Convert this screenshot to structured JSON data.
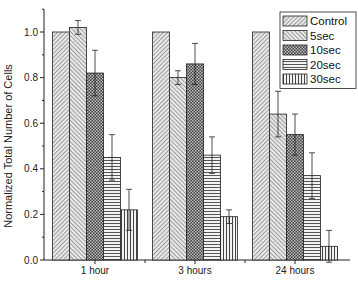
{
  "chart_data": {
    "type": "bar",
    "title": "",
    "xlabel": "",
    "ylabel": "Normalized Total Number of Cells",
    "ylim": [
      0.0,
      1.1
    ],
    "yticks": [
      "0.0",
      "0.2",
      "0.4",
      "0.6",
      "0.8",
      "1.0"
    ],
    "categories": [
      "1 hour",
      "3 hours",
      "24 hours"
    ],
    "grid": false,
    "legend_position": "top-right",
    "series": [
      {
        "name": "Control",
        "pattern": "diag-right",
        "values": [
          1.0,
          1.0,
          1.0
        ],
        "errors": [
          0,
          0,
          0
        ]
      },
      {
        "name": "5sec",
        "pattern": "diag-left",
        "values": [
          1.02,
          0.8,
          0.64
        ],
        "errors": [
          0.03,
          0.03,
          0.1
        ]
      },
      {
        "name": "10sec",
        "pattern": "checker",
        "values": [
          0.82,
          0.86,
          0.55
        ],
        "errors": [
          0.1,
          0.09,
          0.09
        ]
      },
      {
        "name": "20sec",
        "pattern": "horizontal",
        "values": [
          0.45,
          0.46,
          0.37
        ],
        "errors": [
          0.1,
          0.08,
          0.1
        ]
      },
      {
        "name": "30sec",
        "pattern": "vertical",
        "values": [
          0.22,
          0.19,
          0.06
        ],
        "errors": [
          0.09,
          0.03,
          0.07
        ]
      }
    ]
  }
}
